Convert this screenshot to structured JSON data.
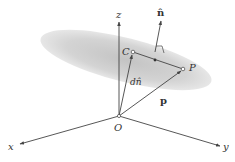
{
  "diagram": {
    "type": "3d-vector-plane",
    "colors": {
      "plane_fill": "#c8c8c8",
      "line": "#444444",
      "text": "#333333",
      "background": "#ffffff"
    },
    "plane": {
      "cx": 126,
      "cy": 60,
      "rx": 88,
      "ry": 22,
      "rotate_deg": 14
    },
    "axes": {
      "origin": {
        "x": 119,
        "y": 116
      },
      "x": {
        "label": "x",
        "end": {
          "x": 20,
          "y": 144
        }
      },
      "y": {
        "label": "y",
        "end": {
          "x": 220,
          "y": 146
        }
      },
      "z": {
        "label": "z",
        "end": {
          "x": 119,
          "y": 22
        }
      }
    },
    "points": {
      "O": {
        "label": "O",
        "x": 119,
        "y": 116
      },
      "C": {
        "label": "C",
        "x": 133,
        "y": 52
      },
      "P": {
        "label": "P",
        "x": 183,
        "y": 69
      },
      "mid": {
        "x": 155,
        "y": 60
      }
    },
    "vectors": {
      "n_hat": {
        "label": "n̂",
        "from": {
          "x": 155,
          "y": 50
        },
        "to": {
          "x": 161,
          "y": 21
        }
      },
      "d_n_hat": {
        "label": "dn̂",
        "from": "O",
        "to": "C"
      },
      "p": {
        "label": "p",
        "from": "O",
        "to": "P"
      }
    },
    "labels": {
      "x": "x",
      "y": "y",
      "z": "z",
      "O": "O",
      "C": "C",
      "P": "P",
      "n_hat": "n̂",
      "d_n_hat": "dn̂",
      "p": "p"
    }
  }
}
